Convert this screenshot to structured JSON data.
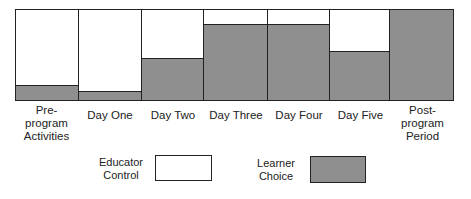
{
  "chart_data": {
    "type": "bar",
    "subtype": "100% stacked",
    "title": "",
    "xlabel": "",
    "ylabel": "",
    "ylim": [
      0,
      100
    ],
    "grid": false,
    "legend_position": "bottom",
    "categories": [
      "Pre-program Activities",
      "Day One",
      "Day Two",
      "Day Three",
      "Day Four",
      "Day Five",
      "Post-program Period"
    ],
    "series": [
      {
        "name": "Learner Choice",
        "color": "#8f8f8f",
        "values": [
          17,
          10,
          47,
          85,
          85,
          54,
          100
        ]
      },
      {
        "name": "Educator Control",
        "color": "#ffffff",
        "values": [
          83,
          90,
          53,
          15,
          15,
          46,
          0
        ]
      }
    ]
  },
  "categories": [
    {
      "line1": "Pre-program",
      "line2": "Activities"
    },
    {
      "line1": "Day One",
      "line2": ""
    },
    {
      "line1": "Day Two",
      "line2": ""
    },
    {
      "line1": "Day Three",
      "line2": ""
    },
    {
      "line1": "Day Four",
      "line2": ""
    },
    {
      "line1": "Day Five",
      "line2": ""
    },
    {
      "line1": "Post-program",
      "line2": "Period"
    }
  ],
  "legend": {
    "educator": {
      "line1": "Educator",
      "line2": "Control",
      "color": "#ffffff"
    },
    "learner": {
      "line1": "Learner",
      "line2": "Choice",
      "color": "#8f8f8f"
    }
  }
}
